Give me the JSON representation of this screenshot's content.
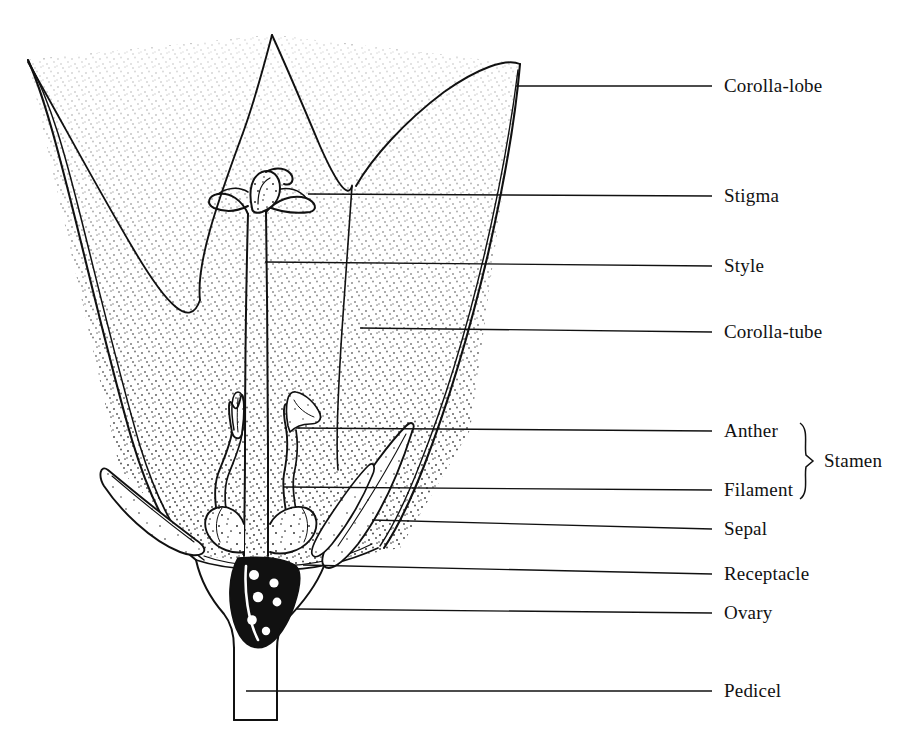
{
  "figure": {
    "style": "line-drawing-stippled",
    "ink_color": "#111111",
    "background_color": "#ffffff"
  },
  "labels": [
    {
      "id": "corolla-lobe",
      "text": "Corolla-lobe",
      "x": 724,
      "y": 86,
      "leader": {
        "from_x": 516,
        "from_y": 86,
        "to_x": 712,
        "to_y": 86
      }
    },
    {
      "id": "stigma",
      "text": "Stigma",
      "x": 724,
      "y": 196,
      "leader": {
        "from_x": 308,
        "from_y": 194,
        "to_x": 712,
        "to_y": 196
      }
    },
    {
      "id": "style",
      "text": "Style",
      "x": 724,
      "y": 266,
      "leader": {
        "from_x": 265,
        "from_y": 262,
        "to_x": 712,
        "to_y": 266
      }
    },
    {
      "id": "corolla-tube",
      "text": "Corolla-tube",
      "x": 724,
      "y": 332,
      "leader": {
        "from_x": 360,
        "from_y": 328,
        "to_x": 712,
        "to_y": 332
      }
    },
    {
      "id": "anther",
      "text": "Anther",
      "x": 724,
      "y": 431,
      "leader": {
        "from_x": 296,
        "from_y": 428,
        "to_x": 712,
        "to_y": 431
      }
    },
    {
      "id": "filament",
      "text": "Filament",
      "x": 724,
      "y": 490,
      "leader": {
        "from_x": 283,
        "from_y": 487,
        "to_x": 712,
        "to_y": 490
      }
    },
    {
      "id": "sepal",
      "text": "Sepal",
      "x": 724,
      "y": 529,
      "leader": {
        "from_x": 372,
        "from_y": 520,
        "to_x": 712,
        "to_y": 529
      }
    },
    {
      "id": "receptacle",
      "text": "Receptacle",
      "x": 724,
      "y": 574,
      "leader": {
        "from_x": 303,
        "from_y": 565,
        "to_x": 712,
        "to_y": 574
      }
    },
    {
      "id": "ovary",
      "text": "Ovary",
      "x": 724,
      "y": 613,
      "leader": {
        "from_x": 297,
        "from_y": 609,
        "to_x": 712,
        "to_y": 613
      }
    },
    {
      "id": "pedicel",
      "text": "Pedicel",
      "x": 724,
      "y": 691,
      "leader": {
        "from_x": 246,
        "from_y": 691,
        "to_x": 712,
        "to_y": 691
      }
    }
  ],
  "groups": [
    {
      "id": "stamen",
      "text": "Stamen",
      "members": [
        "anther",
        "filament"
      ],
      "label_x": 824,
      "label_y": 461,
      "brace": {
        "x": 800,
        "top_y": 423,
        "bottom_y": 499,
        "tip_x": 813,
        "tip_y": 461
      }
    }
  ],
  "parts": [
    {
      "id": "corolla-lobe-left",
      "name": "Corolla lobe (left)"
    },
    {
      "id": "corolla-lobe-middle",
      "name": "Corolla lobe (middle)"
    },
    {
      "id": "corolla-lobe-right",
      "name": "Corolla lobe (right)"
    },
    {
      "id": "corolla-tube",
      "name": "Corolla tube"
    },
    {
      "id": "stigma",
      "name": "Stigma"
    },
    {
      "id": "style",
      "name": "Style"
    },
    {
      "id": "stamen-left",
      "name": "Stamen (left)"
    },
    {
      "id": "stamen-right",
      "name": "Stamen (right)"
    },
    {
      "id": "nectary-left",
      "name": "Nectary gland (left)"
    },
    {
      "id": "nectary-right",
      "name": "Nectary gland (right)"
    },
    {
      "id": "sepal-left",
      "name": "Sepal (left)"
    },
    {
      "id": "sepal-right",
      "name": "Sepal (right)"
    },
    {
      "id": "sepal-right-inner",
      "name": "Sepal (right inner)"
    },
    {
      "id": "ovary",
      "name": "Ovary with ovules"
    },
    {
      "id": "receptacle",
      "name": "Receptacle"
    },
    {
      "id": "pedicel",
      "name": "Pedicel"
    }
  ]
}
